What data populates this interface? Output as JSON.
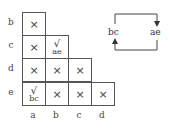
{
  "table": {
    "row_labels": [
      "b",
      "c",
      "d",
      "e"
    ],
    "col_labels": [
      "a",
      "b",
      "c",
      "d"
    ],
    "rows": [
      {
        "row": "b",
        "cells": [
          {
            "mark": "×"
          }
        ]
      },
      {
        "row": "c",
        "cells": [
          {
            "mark": "×"
          },
          {
            "mark": "√",
            "note": "ae"
          }
        ]
      },
      {
        "row": "d",
        "cells": [
          {
            "mark": "×"
          },
          {
            "mark": "×"
          },
          {
            "mark": "×"
          }
        ]
      },
      {
        "row": "e",
        "cells": [
          {
            "mark": "√",
            "note": "bc"
          },
          {
            "mark": "×"
          },
          {
            "mark": "×"
          },
          {
            "mark": "×"
          }
        ]
      }
    ]
  },
  "legend": {
    "left_label": "bc",
    "right_label": "ae"
  }
}
